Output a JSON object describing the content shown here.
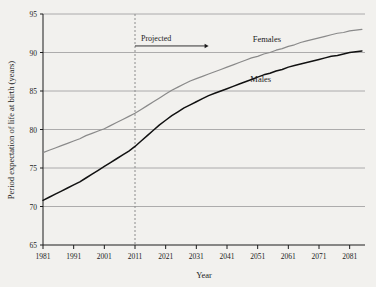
{
  "chart_data": {
    "type": "line",
    "title": "",
    "xlabel": "Year",
    "ylabel": "Period expectation of life at birth (years)",
    "xlim": [
      1981,
      2086
    ],
    "ylim": [
      65,
      95
    ],
    "yticks": [
      65,
      70,
      75,
      80,
      85,
      90,
      95
    ],
    "xticks": [
      1981,
      1991,
      2001,
      2011,
      2021,
      2031,
      2041,
      2051,
      2061,
      2071,
      2081
    ],
    "xtick_labels": [
      "1981",
      "1991",
      "2001",
      "2011",
      "2021",
      "2031",
      "2041",
      "2051",
      "2061",
      "2071",
      "2081"
    ],
    "ytick_labels": [
      "65",
      "70",
      "75",
      "80",
      "85",
      "90",
      "95"
    ],
    "grid": true,
    "grid_axis": "y",
    "legend": "inline-labels",
    "annotations": [
      {
        "text": "Projected",
        "x": 2011,
        "y": 91.5,
        "arrow": "right",
        "arrow_to_x": 2035
      }
    ],
    "projection_start_year": 2011,
    "projection_marker": "dashed-vertical-line",
    "series": [
      {
        "name": "Females",
        "color": "#8a8a8a",
        "label_x": 2054,
        "label_y": 91.3,
        "x": [
          1981,
          1983,
          1985,
          1987,
          1989,
          1991,
          1993,
          1995,
          1997,
          1999,
          2001,
          2003,
          2005,
          2007,
          2009,
          2011,
          2013,
          2015,
          2017,
          2019,
          2021,
          2023,
          2025,
          2027,
          2029,
          2031,
          2033,
          2035,
          2037,
          2039,
          2041,
          2043,
          2045,
          2047,
          2049,
          2051,
          2053,
          2055,
          2057,
          2059,
          2061,
          2063,
          2065,
          2067,
          2069,
          2071,
          2073,
          2075,
          2077,
          2079,
          2081,
          2083,
          2085
        ],
        "values": [
          77.0,
          77.3,
          77.6,
          77.9,
          78.2,
          78.5,
          78.8,
          79.2,
          79.5,
          79.8,
          80.1,
          80.5,
          80.9,
          81.3,
          81.7,
          82.1,
          82.6,
          83.1,
          83.6,
          84.1,
          84.6,
          85.1,
          85.5,
          85.9,
          86.3,
          86.6,
          86.9,
          87.2,
          87.5,
          87.8,
          88.1,
          88.4,
          88.7,
          89.0,
          89.3,
          89.5,
          89.8,
          90.0,
          90.3,
          90.5,
          90.8,
          91.0,
          91.3,
          91.5,
          91.7,
          91.9,
          92.1,
          92.3,
          92.5,
          92.6,
          92.8,
          92.9,
          93.0
        ]
      },
      {
        "name": "Males",
        "color": "#111111",
        "label_x": 2052,
        "label_y": 86.2,
        "x": [
          1981,
          1983,
          1985,
          1987,
          1989,
          1991,
          1993,
          1995,
          1997,
          1999,
          2001,
          2003,
          2005,
          2007,
          2009,
          2011,
          2013,
          2015,
          2017,
          2019,
          2021,
          2023,
          2025,
          2027,
          2029,
          2031,
          2033,
          2035,
          2037,
          2039,
          2041,
          2043,
          2045,
          2047,
          2049,
          2051,
          2053,
          2055,
          2057,
          2059,
          2061,
          2063,
          2065,
          2067,
          2069,
          2071,
          2073,
          2075,
          2077,
          2079,
          2081,
          2083,
          2085
        ],
        "values": [
          70.8,
          71.2,
          71.6,
          72.0,
          72.4,
          72.8,
          73.2,
          73.7,
          74.2,
          74.7,
          75.2,
          75.7,
          76.2,
          76.7,
          77.2,
          77.8,
          78.5,
          79.2,
          79.9,
          80.6,
          81.2,
          81.8,
          82.3,
          82.8,
          83.2,
          83.6,
          84.0,
          84.4,
          84.7,
          85.0,
          85.3,
          85.6,
          85.9,
          86.2,
          86.5,
          86.8,
          87.1,
          87.3,
          87.6,
          87.8,
          88.1,
          88.3,
          88.5,
          88.7,
          88.9,
          89.1,
          89.3,
          89.5,
          89.6,
          89.8,
          90.0,
          90.1,
          90.2
        ]
      }
    ]
  },
  "colors": {
    "background": "#f2f1ee",
    "axis": "#1c1c1c",
    "grid": "#9a9a9a",
    "projection_line": "#8c8c8c",
    "females": "#8a8a8a",
    "males": "#111111"
  }
}
